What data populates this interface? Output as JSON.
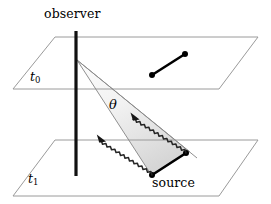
{
  "figure": {
    "labels": {
      "observer": "observer",
      "source": "source",
      "time_upper": "t",
      "time_upper_sub": "0",
      "time_lower": "t",
      "time_lower_sub": "1",
      "angle": "θ"
    },
    "colors": {
      "background": "#ffffff",
      "plane_stroke": "#9a9a9a",
      "cone_stroke": "#8c8c8c",
      "cone_fill_light": "#fafafa",
      "cone_fill_dark": "#d8d8d8",
      "segment_stroke": "#000000",
      "observer_line": "#111111",
      "wavy_stroke": "#2a2a2a",
      "text": "#000000"
    },
    "planes": [
      {
        "name": "upper-plane",
        "time_label": "t0",
        "points": "55,37 258,37 219,89 13,89"
      },
      {
        "name": "lower-plane",
        "time_label": "t1",
        "points": "55,140 258,140 219,196 13,196"
      }
    ],
    "observer_line": {
      "name": "observer-axis",
      "x": 76,
      "y_top": 31,
      "y_bottom": 176,
      "width": 3.2
    },
    "apex": {
      "x": 77,
      "y": 60
    },
    "cone_rays": [
      {
        "name": "cone-ray-upper",
        "x2": 190,
        "y2": 152
      },
      {
        "name": "cone-ray-middle",
        "x2": 196,
        "y2": 157
      },
      {
        "name": "cone-ray-lower",
        "x2": 152,
        "y2": 176
      }
    ],
    "cone_region": "77,60 190,152 152,176",
    "segments": [
      {
        "name": "source-position-at-t0",
        "x1": 152,
        "y1": 75,
        "x2": 185,
        "y2": 54,
        "stroke_width": 2.6,
        "dot_radius": 3.0
      },
      {
        "name": "source-position-at-t1",
        "x1": 152,
        "y1": 175,
        "x2": 186,
        "y2": 153,
        "stroke_width": 2.6,
        "dot_radius": 3.0
      }
    ],
    "wavy_rays": [
      {
        "name": "photon-ray-far",
        "from_x": 186,
        "from_y": 153,
        "to_x": 133,
        "to_y": 113,
        "amplitude": 2.6,
        "period": 6.0
      },
      {
        "name": "photon-ray-near",
        "from_x": 152,
        "from_y": 175,
        "to_x": 101,
        "to_y": 137,
        "amplitude": 2.6,
        "period": 6.0
      }
    ]
  }
}
